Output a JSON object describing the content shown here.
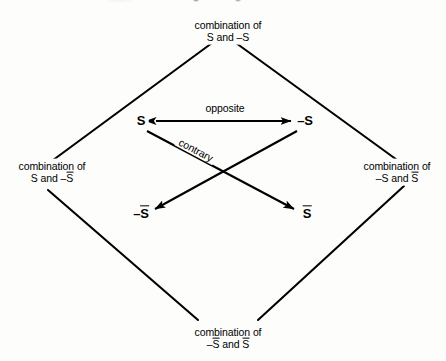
{
  "diagram": {
    "background_color": "#fdfdfc",
    "line_color": "#000000",
    "corners": {
      "top": {
        "line1": "combination of",
        "line2_prefix": "S and ",
        "line2_minus": "–S",
        "line2_bar": ""
      },
      "left": {
        "line1": "combination of",
        "line2_prefix": "S and –",
        "line2_bar": "S"
      },
      "right": {
        "line1": "combination of",
        "line2_prefix": "–S and ",
        "line2_bar": "S"
      },
      "bottom": {
        "line1": "combination of",
        "line2_prefix": "–",
        "line2_bar_a": "S",
        "line2_mid": " and ",
        "line2_bar_b": "S"
      }
    },
    "vertices": {
      "top_left": {
        "text": "S"
      },
      "top_right": {
        "text": "–S"
      },
      "bottom_left": {
        "prefix": "–",
        "bar": "S"
      },
      "bottom_right": {
        "prefix": "",
        "bar": "S"
      }
    },
    "relations": {
      "opposite": "opposite",
      "contrary": "contrary"
    }
  }
}
